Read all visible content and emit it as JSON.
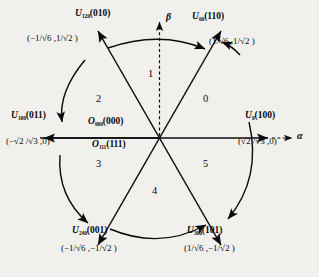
{
  "diagram": {
    "axes": {
      "alpha_label": "α",
      "beta_label": "β"
    },
    "origin_vectors": [
      {
        "name": "O",
        "subscript": "000",
        "switching": "(000)"
      },
      {
        "name": "O",
        "subscript": "111",
        "switching": "(111)"
      }
    ],
    "vectors": [
      {
        "id": "u0",
        "name": "U",
        "subscript": "0",
        "switching": "(100)",
        "angle_deg": 0,
        "coord_text": "(√2 /√3 ,0)",
        "alpha": "√2/√3",
        "beta": "0"
      },
      {
        "id": "u60",
        "name": "U",
        "subscript": "60",
        "switching": "(110)",
        "angle_deg": 60,
        "coord_text": "(1/√6 ,1/√2 )",
        "alpha": "1/√6",
        "beta": "1/√2"
      },
      {
        "id": "u120",
        "name": "U",
        "subscript": "120",
        "switching": "(010)",
        "angle_deg": 120,
        "coord_text": "(−1/√6 ,1/√2 )",
        "alpha": "−1/√6",
        "beta": "1/√2"
      },
      {
        "id": "u180",
        "name": "U",
        "subscript": "180",
        "switching": "(011)",
        "angle_deg": 180,
        "coord_text": "(−√2 /√3 ,0)",
        "alpha": "−√2/√3",
        "beta": "0"
      },
      {
        "id": "u240",
        "name": "U",
        "subscript": "240",
        "switching": "(001)",
        "angle_deg": 240,
        "coord_text": "(−1/√6 ,−1/√2 )",
        "alpha": "−1/√6",
        "beta": "−1/√2"
      },
      {
        "id": "u300",
        "name": "U",
        "subscript": "300",
        "switching": "(101)",
        "angle_deg": 300,
        "coord_text": "(1/√6 ,−1/√2 )",
        "alpha": "1/√6",
        "beta": "−1/√2"
      }
    ],
    "sectors": [
      {
        "label": "0",
        "center_deg": 30
      },
      {
        "label": "1",
        "center_deg": 90
      },
      {
        "label": "2",
        "center_deg": 150
      },
      {
        "label": "3",
        "center_deg": 210
      },
      {
        "label": "4",
        "center_deg": 270
      },
      {
        "label": "5",
        "center_deg": 330
      }
    ],
    "rotation_arrows": [
      {
        "from": "u120",
        "to": "u60",
        "direction": "clockwise"
      },
      {
        "from": "u180",
        "to": "u120",
        "direction": "clockwise"
      },
      {
        "from": "u240",
        "to": "u180",
        "direction": "counter-clockwise"
      },
      {
        "from": "u300",
        "to": "u240",
        "direction": "counter-clockwise"
      },
      {
        "from": "u0",
        "to": "u300",
        "direction": "counter-clockwise"
      }
    ],
    "colors": {
      "ink": "#0b0b0b",
      "background": "#f2f0ed"
    }
  }
}
